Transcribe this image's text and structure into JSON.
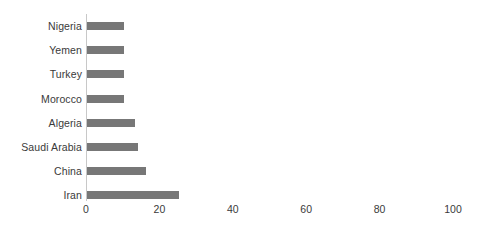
{
  "chart_data": {
    "type": "bar",
    "orientation": "horizontal",
    "title": "",
    "subtitle": "",
    "xlabel": "",
    "ylabel": "",
    "categories": [
      "Nigeria",
      "Yemen",
      "Turkey",
      "Morocco",
      "Algeria",
      "Saudi Arabia",
      "China",
      "Iran"
    ],
    "values": [
      10,
      10,
      10,
      10,
      13,
      14,
      16,
      25
    ],
    "xlim": [
      0,
      100
    ],
    "xticks": [
      0,
      20,
      40,
      60,
      80,
      100
    ],
    "xtick_labels": [
      "0",
      "20",
      "40",
      "60",
      "80",
      "100"
    ],
    "grid": false,
    "legend": null,
    "bar_color": "#777777",
    "axis_color": "#c8c8c8",
    "text_color": "#3a3a3a",
    "background": "#ffffff"
  }
}
